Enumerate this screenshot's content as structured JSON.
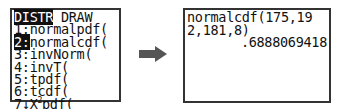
{
  "menu_screen": {
    "tabs": [
      {
        "label": "DISTR",
        "selected": true
      },
      {
        "label": "DRAW",
        "selected": false
      }
    ],
    "items": [
      {
        "num": "1",
        "sep": ":",
        "label": "normalpdf(",
        "selected": false
      },
      {
        "num": "2",
        "sep": ":",
        "label": "normalcdf(",
        "selected": true
      },
      {
        "num": "3",
        "sep": ":",
        "label": "invNorm(",
        "selected": false
      },
      {
        "num": "4",
        "sep": ":",
        "label": "invT(",
        "selected": false
      },
      {
        "num": "5",
        "sep": ":",
        "label": "tpdf(",
        "selected": false
      },
      {
        "num": "6",
        "sep": ":",
        "label": "tcdf(",
        "selected": false
      },
      {
        "num": "7",
        "sep": "↓",
        "label_pre": "X",
        "label_sup": "2",
        "label_post": "pdf(",
        "selected": false
      }
    ]
  },
  "arrow_icon": "right-arrow",
  "result_screen": {
    "input_lines": [
      "normalcdf(175,19",
      "2,181,8)"
    ],
    "result": ".6888069418"
  }
}
